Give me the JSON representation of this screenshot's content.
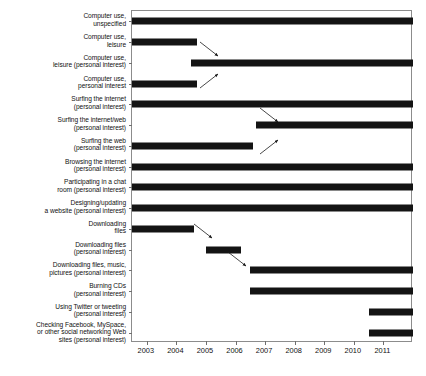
{
  "chart_data": {
    "type": "bar",
    "orientation": "horizontal-timeline",
    "title": "",
    "subtitle": "",
    "xlabel": "",
    "ylabel": "",
    "xlim": [
      2002.5,
      2012.0
    ],
    "xticks": [
      2003,
      2004,
      2005,
      2006,
      2007,
      2008,
      2009,
      2010,
      2011
    ],
    "xtick_labels": [
      "2003",
      "2004",
      "2005",
      "2006",
      "2007",
      "2008",
      "2009",
      "2010",
      "2011"
    ],
    "grid": false,
    "legend": false,
    "bar_color": "#141414",
    "frame_color": "#8c8c8c",
    "categories": [
      "Computer use,\nunspecified",
      "Computer use,\nleisure",
      "Computer use,\nleisure (personal interest)",
      "Computer use,\npersonal interest",
      "Surfing the internet\n(personal interest)",
      "Surfing the internet/web\n(personal interest)",
      "Surfing the web\n(personal interest)",
      "Browsing the internet\n(personal interest)",
      "Participating in a chat\nroom (personal interest)",
      "Designing/updating\na website (personal interest)",
      "Downloading\nfiles",
      "Downloading files\n(personal interest)",
      "Downloading files, music,\npictures (personal interest)",
      "Burning CDs\n(personal interest)",
      "Using Twitter or tweeting\n(personal interest)",
      "Checking Facebook, MySpace,\nor other social networking Web\nsites (personal interest)"
    ],
    "spans": [
      {
        "label": "Computer use, unspecified",
        "start": 2002.5,
        "end": 2012.0
      },
      {
        "label": "Computer use, leisure",
        "start": 2002.5,
        "end": 2004.7
      },
      {
        "label": "Computer use, leisure (personal interest)",
        "start": 2004.5,
        "end": 2012.0
      },
      {
        "label": "Computer use, personal interest",
        "start": 2002.5,
        "end": 2004.7
      },
      {
        "label": "Surfing the internet (personal interest)",
        "start": 2002.5,
        "end": 2012.0
      },
      {
        "label": "Surfing the internet/web (personal interest)",
        "start": 2006.7,
        "end": 2012.0
      },
      {
        "label": "Surfing the web (personal interest)",
        "start": 2002.5,
        "end": 2006.6
      },
      {
        "label": "Browsing the internet (personal interest)",
        "start": 2002.5,
        "end": 2012.0
      },
      {
        "label": "Participating in a chat room (personal interest)",
        "start": 2002.5,
        "end": 2012.0
      },
      {
        "label": "Designing/updating a website (personal interest)",
        "start": 2002.5,
        "end": 2012.0
      },
      {
        "label": "Downloading files",
        "start": 2002.5,
        "end": 2004.6
      },
      {
        "label": "Downloading files (personal interest)",
        "start": 2005.0,
        "end": 2006.2
      },
      {
        "label": "Downloading files, music, pictures (personal interest)",
        "start": 2006.5,
        "end": 2012.0
      },
      {
        "label": "Burning CDs (personal interest)",
        "start": 2006.5,
        "end": 2012.0
      },
      {
        "label": "Using Twitter or tweeting (personal interest)",
        "start": 2010.5,
        "end": 2012.0
      },
      {
        "label": "Checking Facebook, MySpace, or other social networking Web sites (personal interest)",
        "start": 2010.5,
        "end": 2012.0
      }
    ],
    "annotations": [
      {
        "name": "arrow-leisure-to-leisure-personal-interest",
        "from_row": 1,
        "to_row": 2,
        "direction": "down-right"
      },
      {
        "name": "arrow-leisure-personal-interest-to-personal-interest",
        "from_row": 3,
        "to_row": 2,
        "direction": "up-right"
      },
      {
        "name": "arrow-surfing-internet-to-surfing-internet-web",
        "from_row": 4,
        "to_row": 5,
        "direction": "down-right"
      },
      {
        "name": "arrow-surfing-web-to-surfing-internet-web",
        "from_row": 6,
        "to_row": 5,
        "direction": "up-right"
      },
      {
        "name": "arrow-downloading-files-to-downloading-files-personal-interest",
        "from_row": 10,
        "to_row": 11,
        "direction": "down-right"
      },
      {
        "name": "arrow-downloading-files-personal-interest-to-downloading-files-music",
        "from_row": 11,
        "to_row": 12,
        "direction": "down-right"
      }
    ]
  }
}
